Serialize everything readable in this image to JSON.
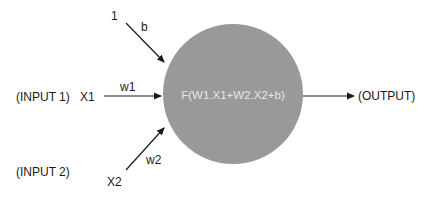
{
  "diagram": {
    "neuron": {
      "formula": "F(W1.X1+W2.X2+b)",
      "fill_color": "#999999",
      "text_color": "#e6e6e6"
    },
    "bias": {
      "input_value": "1",
      "weight_label": "b"
    },
    "input1": {
      "label": "(INPUT 1)",
      "variable": "X1",
      "weight_label": "w1"
    },
    "input2": {
      "label": "(INPUT 2)",
      "variable": "X2",
      "weight_label": "w2"
    },
    "output": {
      "label": "(OUTPUT)"
    },
    "colors": {
      "arrow": "#1a1a1a",
      "text": "#1a1a1a",
      "background": "#ffffff"
    }
  }
}
